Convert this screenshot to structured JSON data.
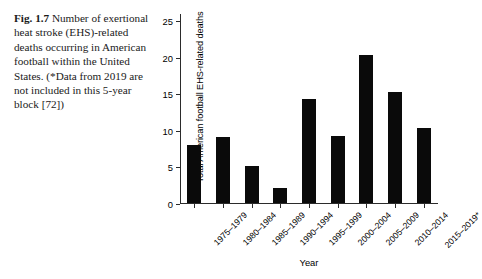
{
  "caption": {
    "label": "Fig. 1.7",
    "text": "Number of exertional heat stroke (EHS)-related deaths occurring in American football within the United States. (*Data from 2019 are not included in this 5-year block [72])"
  },
  "chart_data": {
    "type": "bar",
    "title": "",
    "xlabel": "Year",
    "ylabel": "Total American football EHS-related deaths",
    "categories": [
      "1975–1979",
      "1980–1984",
      "1985–1989",
      "1990–1994",
      "1995–1999",
      "2000–2004",
      "2005–2009",
      "2010–2014",
      "2015–2019*"
    ],
    "values": [
      8,
      9,
      5,
      2,
      14.2,
      9.2,
      20.2,
      15.2,
      10.3
    ],
    "ylim": [
      0,
      26
    ],
    "yticks": [
      0,
      5,
      10,
      15,
      20,
      25
    ],
    "ytick_labels": [
      "0",
      "5",
      "10",
      "15",
      "20",
      "25"
    ],
    "grid": false,
    "legend": null,
    "bar_color": "#0a0a0a",
    "axis_color": "#2b2b2b"
  }
}
